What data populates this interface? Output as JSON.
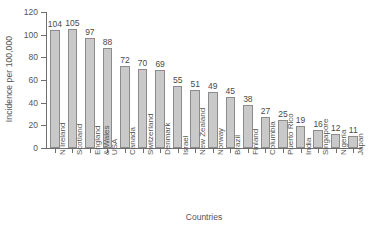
{
  "chart_data": {
    "type": "bar",
    "title": "",
    "xlabel": "Countries",
    "ylabel": "Incidence per 100,000",
    "ylim": [
      0,
      120
    ],
    "yticks": [
      0,
      20,
      40,
      60,
      80,
      100,
      120
    ],
    "grid": false,
    "legend": false,
    "categories": [
      "N Ireland",
      "Scotland",
      "England\n& Wales",
      "USA",
      "Canada",
      "Switzerland",
      "Denmark",
      "Israel",
      "New Zealand",
      "Norway",
      "Brazil",
      "Finland",
      "Columbia",
      "Puerto Rico",
      "India",
      "Singapore",
      "Nigeria",
      "Japan"
    ],
    "values": [
      104,
      105,
      97,
      88,
      72,
      70,
      69,
      55,
      51,
      49,
      45,
      38,
      27,
      25,
      19,
      16,
      12,
      11
    ],
    "value_labels": [
      "104",
      "105",
      "97",
      "88",
      "72",
      "70",
      "69",
      "55",
      "51",
      "49",
      "45",
      "38",
      "27",
      "25",
      "19",
      "16",
      "12",
      "11"
    ],
    "ytick_labels": [
      "0",
      "20",
      "40",
      "60",
      "80",
      "100",
      "120"
    ],
    "colors": {
      "bar_fill": "#c9c9c9",
      "bar_border": "#8c8c8c",
      "axis": "#6f6f6f",
      "text": "#555555",
      "background": "#ffffff"
    }
  }
}
